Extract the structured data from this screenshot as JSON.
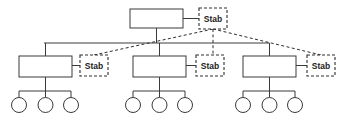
{
  "diagram": {
    "type": "organizational-chart",
    "title": "",
    "colors": {
      "line": "#3a3a3a",
      "dashed_line": "#2e2e2e",
      "box_fill": "#ffffff",
      "background": "#ffffff",
      "text": "#1b1b1b"
    },
    "top_unit": {
      "label": "",
      "x": 130,
      "y": 9,
      "w": 53,
      "h": 19
    },
    "staff_nodes": [
      {
        "label": "Stab",
        "x": 199,
        "y": 8,
        "w": 28,
        "h": 21,
        "attached_to": "top-unit"
      },
      {
        "label": "Stab",
        "x": 80,
        "y": 55,
        "w": 28,
        "h": 21,
        "attached_to": "division-1"
      },
      {
        "label": "Stab",
        "x": 196,
        "y": 55,
        "w": 28,
        "h": 21,
        "attached_to": "division-2"
      },
      {
        "label": "Stab",
        "x": 307,
        "y": 55,
        "w": 28,
        "h": 21,
        "attached_to": "division-3"
      }
    ],
    "divisions": [
      {
        "label": "",
        "x": 19,
        "y": 56,
        "w": 53,
        "h": 21,
        "center_x": 45.5
      },
      {
        "label": "",
        "x": 133,
        "y": 56,
        "w": 53,
        "h": 21,
        "center_x": 159.5
      },
      {
        "label": "",
        "x": 243,
        "y": 56,
        "w": 53,
        "h": 21,
        "center_x": 269.5
      }
    ],
    "bus_line": {
      "y": 43,
      "x_start": 44,
      "x_end": 269
    },
    "leaf_groups": [
      {
        "parent": "division-1",
        "bar_y": 91,
        "circle_y": 105,
        "radius": 7.5,
        "centers": [
          19,
          45.5,
          71
        ]
      },
      {
        "parent": "division-2",
        "bar_y": 91,
        "circle_y": 105,
        "radius": 7.5,
        "centers": [
          133,
          159.5,
          185
        ]
      },
      {
        "parent": "division-3",
        "bar_y": 91,
        "circle_y": 105,
        "radius": 7.5,
        "centers": [
          243,
          269.5,
          295
        ]
      }
    ]
  }
}
